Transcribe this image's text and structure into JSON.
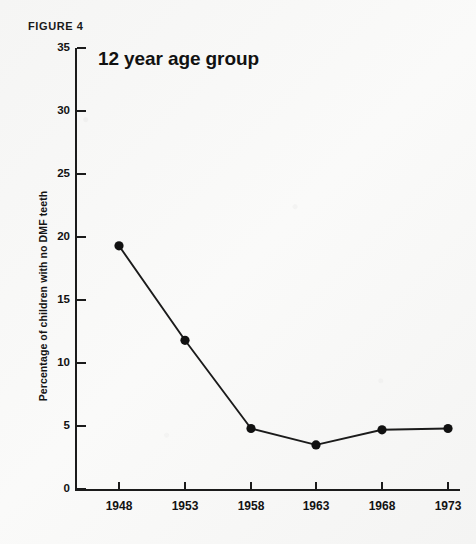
{
  "figure": {
    "label": "FIGURE 4",
    "title": "12 year age group"
  },
  "colors": {
    "background": "#f7f7f6",
    "ink": "#1b1b1b",
    "marker": "#111111"
  },
  "chart_data": {
    "type": "line",
    "title": "12 year age group",
    "xlabel": "",
    "ylabel": "Percentage of children with no DMF teeth",
    "x": [
      1948,
      1953,
      1958,
      1963,
      1968,
      1973
    ],
    "values": [
      19.3,
      11.8,
      4.8,
      3.5,
      4.7,
      4.8
    ],
    "xticklabels": [
      "1948",
      "1953",
      "1958",
      "1963",
      "1968",
      "1973"
    ],
    "yticklabels": [
      "0",
      "5",
      "10",
      "15",
      "20",
      "25",
      "30",
      "35"
    ],
    "yticks": [
      0,
      5,
      10,
      15,
      20,
      25,
      30,
      35
    ],
    "ylim": [
      0,
      35
    ],
    "xlim": [
      1946,
      1975
    ],
    "grid": false,
    "legend": false,
    "marker": "filled-circle"
  }
}
